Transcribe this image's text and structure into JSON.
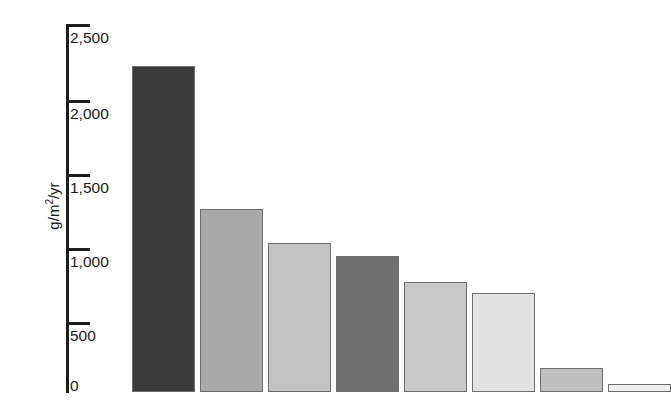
{
  "chart_data": {
    "type": "bar",
    "title": "",
    "subtitle": "",
    "xlabel": "",
    "ylabel": "g/m2/yr",
    "ylabel_display": "g/m/yr",
    "ylabel_parts": {
      "pre": "g/m",
      "sup": "2",
      "post": "/yr"
    },
    "ylim": [
      0,
      2500
    ],
    "grid": false,
    "legend": false,
    "y_ticks": [
      0,
      500,
      1000,
      1500,
      2000,
      2500
    ],
    "y_tick_labels": [
      "0",
      "500",
      "1,000",
      "1,500",
      "2,000",
      "2,500"
    ],
    "categories": [
      "1",
      "2",
      "3",
      "4",
      "5",
      "6",
      "7",
      "8"
    ],
    "values": [
      2215,
      1240,
      1010,
      925,
      750,
      670,
      160,
      55
    ],
    "bar_colors": [
      "#3b3b3b",
      "#a9a9a9",
      "#c3c3c3",
      "#6f6f6f",
      "#c9c9c9",
      "#e2e2e2",
      "#bebebe",
      "#efefef"
    ],
    "bar_edge_color": "#6d6d6d",
    "bars": [
      {
        "name": "bar-1",
        "value": 2215,
        "color": "#3b3b3b"
      },
      {
        "name": "bar-2",
        "value": 1240,
        "color": "#a9a9a9"
      },
      {
        "name": "bar-3",
        "value": 1010,
        "color": "#c3c3c3"
      },
      {
        "name": "bar-4",
        "value": 925,
        "color": "#6f6f6f"
      },
      {
        "name": "bar-5",
        "value": 750,
        "color": "#c9c9c9"
      },
      {
        "name": "bar-6",
        "value": 670,
        "color": "#e2e2e2"
      },
      {
        "name": "bar-7",
        "value": 160,
        "color": "#bebebe"
      },
      {
        "name": "bar-8",
        "value": 55,
        "color": "#efefef"
      }
    ]
  },
  "axis": {
    "tick_labels": {
      "t2500": "2,500",
      "t2000": "2,000",
      "t1500": "1,500",
      "t1000": "1,000",
      "t500": "500",
      "t0": "0"
    }
  },
  "colors": {
    "axis": "#1c1c1c",
    "text": "#1a1a1a",
    "background": "#ffffff"
  }
}
